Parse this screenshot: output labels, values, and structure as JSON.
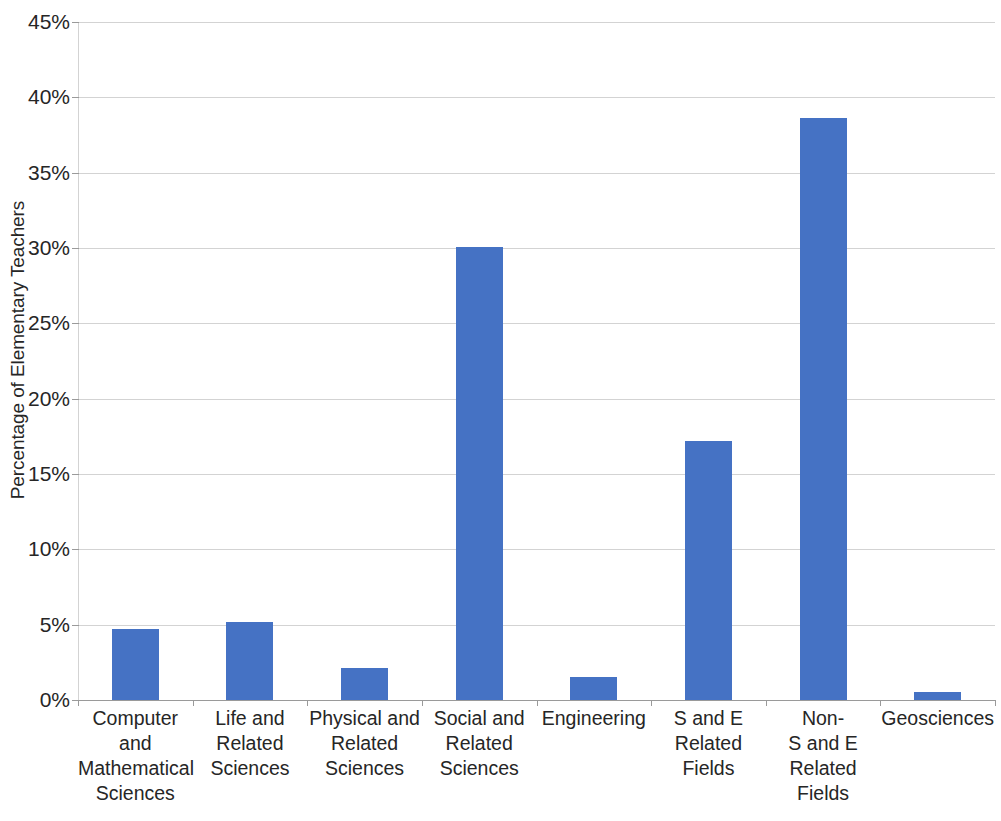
{
  "chart_data": {
    "type": "bar",
    "title": "",
    "subtitle": "",
    "xlabel": "",
    "ylabel": "Percentage of Elementary Teachers",
    "ylim": [
      0,
      45
    ],
    "ytick_step": 5,
    "ytick_labels": [
      "0%",
      "5%",
      "10%",
      "15%",
      "20%",
      "25%",
      "30%",
      "35%",
      "40%",
      "45%"
    ],
    "ytick_values": [
      0,
      5,
      10,
      15,
      20,
      25,
      30,
      35,
      40,
      45
    ],
    "grid": true,
    "legend": false,
    "legend_position": "none",
    "bar_color": "#4572C4",
    "gridline_color": "#D3D3D3",
    "axis_color": "#9A9A9A",
    "text_color": "#262626",
    "categories": [
      "Computer and Mathematical Sciences",
      "Life and Related Sciences",
      "Physical and Related Sciences",
      "Social and Related Sciences",
      "Engineering",
      "S and E Related Fields",
      "Non-S and E Related Fields",
      "Geosciences"
    ],
    "category_label_lines": [
      [
        "Computer and",
        "Mathematical",
        "Sciences"
      ],
      [
        "Life and",
        "Related",
        "Sciences"
      ],
      [
        "Physical and",
        "Related",
        "Sciences"
      ],
      [
        "Social and",
        "Related",
        "Sciences"
      ],
      [
        "Engineering"
      ],
      [
        "S and E",
        "Related",
        "Fields"
      ],
      [
        "Non-",
        "S and E",
        "Related",
        "Fields"
      ],
      [
        "Geosciences"
      ]
    ],
    "values": [
      4.7,
      5.2,
      2.1,
      30.1,
      1.5,
      17.2,
      38.6,
      0.5
    ]
  }
}
